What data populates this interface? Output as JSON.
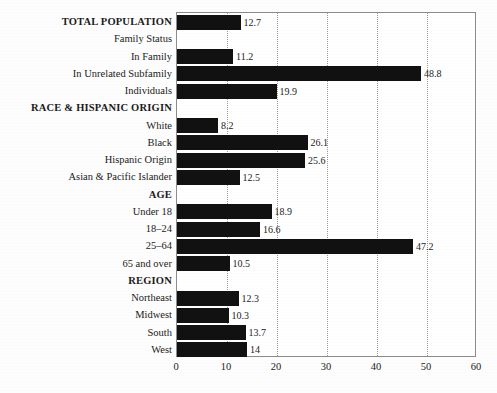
{
  "chart_data": {
    "type": "bar",
    "orientation": "horizontal",
    "title": "",
    "xlabel": "",
    "ylabel": "",
    "xlim": [
      0,
      60
    ],
    "xticks": [
      0,
      10,
      20,
      30,
      40,
      50,
      60
    ],
    "grid": "vertical-dotted",
    "legend": "none",
    "bar_color": "#111111",
    "categories": [
      "TOTAL POPULATION",
      "Family Status",
      "In Family",
      "In Unrelated Subfamily",
      "Individuals",
      "RACE & HISPANIC ORIGIN",
      "White",
      "Black",
      "Hispanic Origin",
      "Asian & Pacific Islander",
      "AGE",
      "Under 18",
      "18–24",
      "25–64",
      "65 and over",
      "REGION",
      "Northeast",
      "Midwest",
      "South",
      "West"
    ],
    "values": [
      12.7,
      null,
      11.2,
      48.8,
      19.9,
      null,
      8.2,
      26.1,
      25.6,
      12.5,
      null,
      18.9,
      16.6,
      47.2,
      10.5,
      null,
      12.3,
      10.3,
      13.7,
      14
    ]
  },
  "rows": [
    {
      "label": "TOTAL POPULATION",
      "value": 12.7,
      "value_text": "12.7",
      "style": "header",
      "has_bar": true
    },
    {
      "label": "Family Status",
      "value": null,
      "value_text": "",
      "style": "subheader",
      "has_bar": false
    },
    {
      "label": "In Family",
      "value": 11.2,
      "value_text": "11.2",
      "style": "item",
      "has_bar": true
    },
    {
      "label": "In Unrelated Subfamily",
      "value": 48.8,
      "value_text": "48.8",
      "style": "item",
      "has_bar": true
    },
    {
      "label": "Individuals",
      "value": 19.9,
      "value_text": "19.9",
      "style": "item",
      "has_bar": true
    },
    {
      "label": "RACE & HISPANIC ORIGIN",
      "value": null,
      "value_text": "",
      "style": "header",
      "has_bar": false
    },
    {
      "label": "White",
      "value": 8.2,
      "value_text": "8.2",
      "style": "item",
      "has_bar": true
    },
    {
      "label": "Black",
      "value": 26.1,
      "value_text": "26.1",
      "style": "item",
      "has_bar": true
    },
    {
      "label": "Hispanic Origin",
      "value": 25.6,
      "value_text": "25.6",
      "style": "item",
      "has_bar": true
    },
    {
      "label": "Asian & Pacific Islander",
      "value": 12.5,
      "value_text": "12.5",
      "style": "item",
      "has_bar": true
    },
    {
      "label": "AGE",
      "value": null,
      "value_text": "",
      "style": "header",
      "has_bar": false
    },
    {
      "label": "Under 18",
      "value": 18.9,
      "value_text": "18.9",
      "style": "item",
      "has_bar": true
    },
    {
      "label": "18–24",
      "value": 16.6,
      "value_text": "16.6",
      "style": "item",
      "has_bar": true
    },
    {
      "label": "25–64",
      "value": 47.2,
      "value_text": "47.2",
      "style": "item",
      "has_bar": true
    },
    {
      "label": "65 and over",
      "value": 10.5,
      "value_text": "10.5",
      "style": "item",
      "has_bar": true
    },
    {
      "label": "REGION",
      "value": null,
      "value_text": "",
      "style": "header",
      "has_bar": false
    },
    {
      "label": "Northeast",
      "value": 12.3,
      "value_text": "12.3",
      "style": "item",
      "has_bar": true
    },
    {
      "label": "Midwest",
      "value": 10.3,
      "value_text": "10.3",
      "style": "item",
      "has_bar": true
    },
    {
      "label": "South",
      "value": 13.7,
      "value_text": "13.7",
      "style": "item",
      "has_bar": true
    },
    {
      "label": "West",
      "value": 14,
      "value_text": "14",
      "style": "item",
      "has_bar": true
    }
  ],
  "axis": {
    "ticks": [
      "0",
      "10",
      "20",
      "30",
      "40",
      "50",
      "60"
    ],
    "tick_values": [
      0,
      10,
      20,
      30,
      40,
      50,
      60
    ],
    "min": 0,
    "max": 60
  }
}
